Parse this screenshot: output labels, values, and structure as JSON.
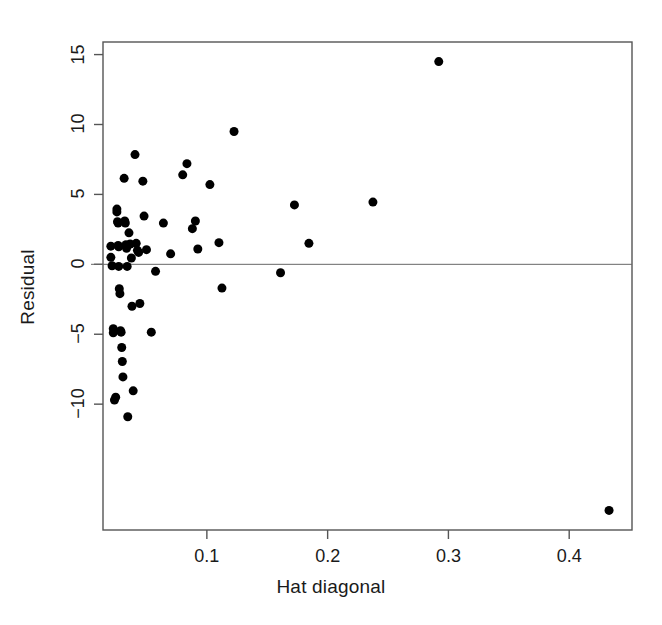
{
  "chart_data": {
    "type": "scatter",
    "title": "",
    "xlabel": "Hat diagonal",
    "ylabel": "Residual",
    "xlim": [
      0.014,
      0.452
    ],
    "ylim": [
      -19.0,
      15.9
    ],
    "xticks": [
      0.1,
      0.2,
      0.3,
      0.4
    ],
    "xtick_labels": [
      "0.1",
      "0.2",
      "0.3",
      "0.4"
    ],
    "yticks": [
      15,
      10,
      5,
      0,
      -5,
      -10
    ],
    "ytick_labels": [
      "15",
      "10",
      "5",
      "0",
      "-5",
      "-10"
    ],
    "grid": false,
    "legend": null,
    "marker": "filled-circle",
    "marker_color": "#000000",
    "marker_size_px": 9,
    "frame_color": "#555555",
    "reference_lines": [
      {
        "orientation": "horizontal",
        "y": 0,
        "color": "#666666",
        "width_px": 1
      }
    ],
    "points": [
      {
        "x": 0.0205,
        "y": 1.3
      },
      {
        "x": 0.0205,
        "y": 0.5
      },
      {
        "x": 0.0215,
        "y": -0.1
      },
      {
        "x": 0.0225,
        "y": -4.6
      },
      {
        "x": 0.0225,
        "y": -4.9
      },
      {
        "x": 0.0235,
        "y": -9.7
      },
      {
        "x": 0.0245,
        "y": -9.5
      },
      {
        "x": 0.0255,
        "y": 3.95
      },
      {
        "x": 0.0255,
        "y": 3.75
      },
      {
        "x": 0.026,
        "y": 3.05
      },
      {
        "x": 0.0265,
        "y": 2.95
      },
      {
        "x": 0.0265,
        "y": 1.35
      },
      {
        "x": 0.027,
        "y": 1.25
      },
      {
        "x": 0.027,
        "y": -0.15
      },
      {
        "x": 0.0275,
        "y": -1.75
      },
      {
        "x": 0.028,
        "y": -2.1
      },
      {
        "x": 0.0285,
        "y": -4.75
      },
      {
        "x": 0.029,
        "y": -4.85
      },
      {
        "x": 0.0295,
        "y": -5.95
      },
      {
        "x": 0.03,
        "y": -6.95
      },
      {
        "x": 0.0305,
        "y": -8.05
      },
      {
        "x": 0.0315,
        "y": 6.15
      },
      {
        "x": 0.032,
        "y": 3.1
      },
      {
        "x": 0.0325,
        "y": 2.95
      },
      {
        "x": 0.033,
        "y": 1.4
      },
      {
        "x": 0.0335,
        "y": 1.15
      },
      {
        "x": 0.034,
        "y": -0.15
      },
      {
        "x": 0.0345,
        "y": -10.9
      },
      {
        "x": 0.0355,
        "y": 2.25
      },
      {
        "x": 0.0365,
        "y": 1.45
      },
      {
        "x": 0.0375,
        "y": 0.45
      },
      {
        "x": 0.038,
        "y": -3.0
      },
      {
        "x": 0.039,
        "y": -9.05
      },
      {
        "x": 0.0405,
        "y": 7.85
      },
      {
        "x": 0.0415,
        "y": 1.5
      },
      {
        "x": 0.0425,
        "y": 1.0
      },
      {
        "x": 0.0435,
        "y": 0.85
      },
      {
        "x": 0.0445,
        "y": -2.8
      },
      {
        "x": 0.047,
        "y": 5.95
      },
      {
        "x": 0.048,
        "y": 3.45
      },
      {
        "x": 0.05,
        "y": 1.05
      },
      {
        "x": 0.054,
        "y": -4.85
      },
      {
        "x": 0.0575,
        "y": -0.5
      },
      {
        "x": 0.064,
        "y": 2.95
      },
      {
        "x": 0.07,
        "y": 0.75
      },
      {
        "x": 0.08,
        "y": 6.4
      },
      {
        "x": 0.0835,
        "y": 7.2
      },
      {
        "x": 0.088,
        "y": 2.55
      },
      {
        "x": 0.0905,
        "y": 3.1
      },
      {
        "x": 0.0925,
        "y": 1.1
      },
      {
        "x": 0.1025,
        "y": 5.7
      },
      {
        "x": 0.11,
        "y": 1.55
      },
      {
        "x": 0.1125,
        "y": -1.7
      },
      {
        "x": 0.1225,
        "y": 9.5
      },
      {
        "x": 0.161,
        "y": -0.6
      },
      {
        "x": 0.1725,
        "y": 4.25
      },
      {
        "x": 0.1845,
        "y": 1.5
      },
      {
        "x": 0.2375,
        "y": 4.45
      },
      {
        "x": 0.292,
        "y": 14.5
      },
      {
        "x": 0.433,
        "y": -17.6
      }
    ]
  },
  "plot_geometry": {
    "frame_left_px": 103,
    "frame_right_px": 632,
    "frame_top_px": 42,
    "frame_bottom_px": 530
  }
}
